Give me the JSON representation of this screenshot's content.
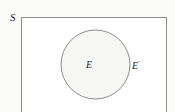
{
  "figure": {
    "type": "venn-diagram",
    "width": 175,
    "height": 112,
    "background_color": "#fbfbfa"
  },
  "universal_set": {
    "label": "S",
    "shape": "rectangle",
    "fill_color": "#ffffff",
    "stroke_color": "#8c8c8c",
    "x": 21,
    "y": 17,
    "width": 145,
    "height": 95,
    "label_x": 10,
    "label_y": 12,
    "note_clipped_bottom": true
  },
  "event_set": {
    "label": "E",
    "shape": "circle",
    "fill_color": "#f6f6f5",
    "stroke_color": "#8c8c8c",
    "center_x": 95.5,
    "center_y": 64.5,
    "radius": 34.5,
    "label_x": 86,
    "label_y": 60
  },
  "complement_set": {
    "label": "E",
    "prime": "′",
    "full_label": "E′",
    "region": "inside rectangle, outside circle",
    "label_x": 132,
    "label_y": 60
  },
  "colors": {
    "page_background": "#fbfbfa",
    "rect_fill": "#ffffff",
    "circle_fill": "#f6f6f5",
    "stroke": "#8c8c8c",
    "text": "#1c1c1c"
  }
}
